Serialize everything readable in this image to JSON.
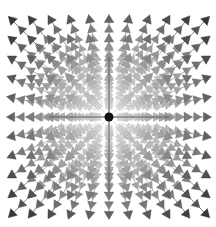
{
  "figure": {
    "type": "3d-vector-field-quiver",
    "background": "#ffffff",
    "center": {
      "x": 109,
      "y": 117,
      "radius": 4.5,
      "color": "#111111"
    },
    "axis_lines": {
      "color": "#555555"
    },
    "grid": {
      "rows": 11,
      "cols": 11,
      "depth": 6
    },
    "cone_colors": {
      "near": "#3a3a3a",
      "mid": "#8a8a8a",
      "far": "#d8d8d8"
    }
  }
}
